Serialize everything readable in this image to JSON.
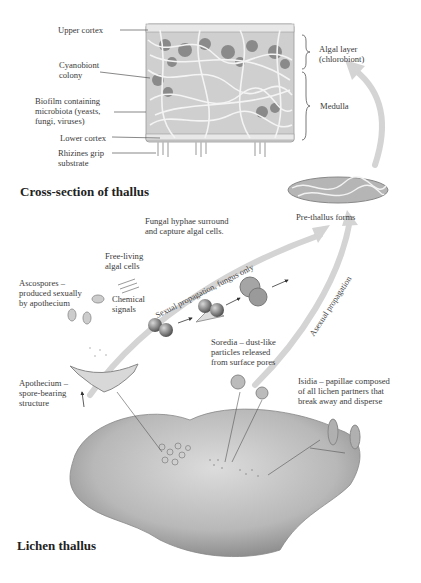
{
  "cross_section": {
    "title": "Cross-section of thallus",
    "labels": {
      "upper_cortex": "Upper cortex",
      "cyanobiont": "Cyanobiont\ncolony",
      "biofilm": "Biofilm containing\nmicrobiota (yeasts,\nfungi, viruses)",
      "lower_cortex": "Lower cortex",
      "rhizines": "Rhizines grip\nsubstrate",
      "algal_layer": "Algal layer\n(chlorobiont)",
      "medulla": "Medulla"
    }
  },
  "formation": {
    "fungal_hyphae": "Fungal hyphae surround\nand capture algal cells.",
    "free_living": "Free-living\nalgal cells",
    "chemical_signals": "Chemical\nsignals",
    "ascospores": "Ascospores –\nproduced sexually\nby apothecium",
    "pre_thallus": "Pre-thallus forms"
  },
  "arrows": {
    "sexual": "Sexual propagation, fungus only",
    "asexual": "Asexual propagation"
  },
  "thallus": {
    "title": "Lichen thallus",
    "apothecium": "Apothecium –\nspore-bearing\nstructure",
    "soredia": "Soredia – dust-like\nparticles released\nfrom surface pores",
    "isidia": "Isidia – papillae composed\nof all lichen partners that\nbreak away and disperse"
  },
  "colors": {
    "arrow_gray": "#d4d4d4",
    "line": "#555555",
    "text": "#3a3a3a",
    "thallus_light": "#cfcfcf",
    "thallus_dark": "#8a8a8a"
  }
}
